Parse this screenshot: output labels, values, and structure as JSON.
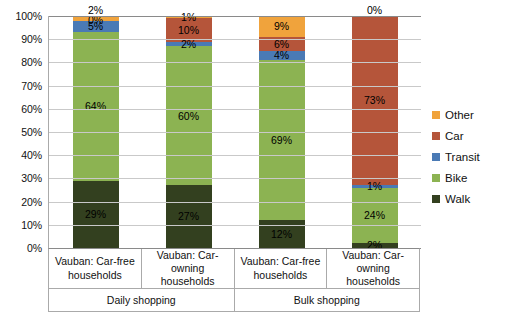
{
  "chart_data": {
    "type": "bar",
    "title": "",
    "xlabel": "",
    "ylabel": "",
    "stacked": true,
    "stack_mode": "percent",
    "grid": true,
    "legend_position": "right",
    "ylim": [
      0,
      100
    ],
    "y_ticks": [
      "0%",
      "10%",
      "20%",
      "30%",
      "40%",
      "50%",
      "60%",
      "70%",
      "80%",
      "90%",
      "100%"
    ],
    "categories": [
      "Vauban: Car-free households",
      "Vauban: Car-owning households",
      "Vauban: Car-free households",
      "Vauban: Car-owning households"
    ],
    "groups": [
      {
        "label": "Daily shopping",
        "span": 2
      },
      {
        "label": "Bulk shopping",
        "span": 2
      }
    ],
    "series": [
      {
        "name": "Walk",
        "color": "#33401f",
        "values": [
          29,
          27,
          12,
          2
        ]
      },
      {
        "name": "Bike",
        "color": "#8cb352",
        "values": [
          64,
          60,
          69,
          24
        ]
      },
      {
        "name": "Transit",
        "color": "#4a7ab5",
        "values": [
          5,
          2,
          4,
          1
        ]
      },
      {
        "name": "Car",
        "color": "#b5553a",
        "values": [
          0,
          10,
          6,
          73
        ]
      },
      {
        "name": "Other",
        "color": "#f0a33c",
        "values": [
          2,
          1,
          9,
          0
        ]
      }
    ],
    "legend": [
      {
        "label": "Other",
        "color": "#f0a33c"
      },
      {
        "label": "Car",
        "color": "#b5553a"
      },
      {
        "label": "Transit",
        "color": "#4a7ab5"
      },
      {
        "label": "Bike",
        "color": "#8cb352"
      },
      {
        "label": "Walk",
        "color": "#33401f"
      }
    ],
    "bars": [
      {
        "category": "Vauban: Car-free households",
        "group": "Daily shopping",
        "segments": [
          {
            "name": "Walk",
            "value": 29,
            "label": "29%",
            "color": "#33401f",
            "label_color": "#000000",
            "label_outside": false
          },
          {
            "name": "Bike",
            "value": 64,
            "label": "64%",
            "color": "#8cb352",
            "label_color": "#000000",
            "label_outside": false
          },
          {
            "name": "Transit",
            "value": 5,
            "label": "5%",
            "color": "#4a7ab5",
            "label_color": "#000000",
            "label_outside": false
          },
          {
            "name": "Car",
            "value": 0,
            "label": "0%",
            "color": "#b5553a",
            "label_color": "#000000",
            "label_outside": false
          },
          {
            "name": "Other",
            "value": 2,
            "label": "2%",
            "color": "#f0a33c",
            "label_color": "#000000",
            "label_outside": true
          }
        ]
      },
      {
        "category": "Vauban: Car-owning households",
        "group": "Daily shopping",
        "segments": [
          {
            "name": "Walk",
            "value": 27,
            "label": "27%",
            "color": "#33401f",
            "label_color": "#000000",
            "label_outside": false
          },
          {
            "name": "Bike",
            "value": 60,
            "label": "60%",
            "color": "#8cb352",
            "label_color": "#000000",
            "label_outside": false
          },
          {
            "name": "Transit",
            "value": 2,
            "label": "2%",
            "color": "#4a7ab5",
            "label_color": "#000000",
            "label_outside": false
          },
          {
            "name": "Car",
            "value": 10,
            "label": "10%",
            "color": "#b5553a",
            "label_color": "#000000",
            "label_outside": false
          },
          {
            "name": "Other",
            "value": 1,
            "label": "1%",
            "color": "#f0a33c",
            "label_color": "#000000",
            "label_outside": false
          }
        ]
      },
      {
        "category": "Vauban: Car-free households",
        "group": "Bulk shopping",
        "segments": [
          {
            "name": "Walk",
            "value": 12,
            "label": "12%",
            "color": "#33401f",
            "label_color": "#000000",
            "label_outside": false
          },
          {
            "name": "Bike",
            "value": 69,
            "label": "69%",
            "color": "#8cb352",
            "label_color": "#000000",
            "label_outside": false
          },
          {
            "name": "Transit",
            "value": 4,
            "label": "4%",
            "color": "#4a7ab5",
            "label_color": "#000000",
            "label_outside": false
          },
          {
            "name": "Car",
            "value": 6,
            "label": "6%",
            "color": "#b5553a",
            "label_color": "#000000",
            "label_outside": false
          },
          {
            "name": "Other",
            "value": 9,
            "label": "9%",
            "color": "#f0a33c",
            "label_color": "#000000",
            "label_outside": false
          }
        ]
      },
      {
        "category": "Vauban: Car-owning households",
        "group": "Bulk shopping",
        "segments": [
          {
            "name": "Walk",
            "value": 2,
            "label": "2%",
            "color": "#33401f",
            "label_color": "#000000",
            "label_outside": false
          },
          {
            "name": "Bike",
            "value": 24,
            "label": "24%",
            "color": "#8cb352",
            "label_color": "#000000",
            "label_outside": false
          },
          {
            "name": "Transit",
            "value": 1,
            "label": "1%",
            "color": "#4a7ab5",
            "label_color": "#000000",
            "label_outside": false
          },
          {
            "name": "Car",
            "value": 73,
            "label": "73%",
            "color": "#b5553a",
            "label_color": "#000000",
            "label_outside": false
          },
          {
            "name": "Other",
            "value": 0,
            "label": "0%",
            "color": "#f0a33c",
            "label_color": "#000000",
            "label_outside": true
          }
        ]
      }
    ]
  }
}
